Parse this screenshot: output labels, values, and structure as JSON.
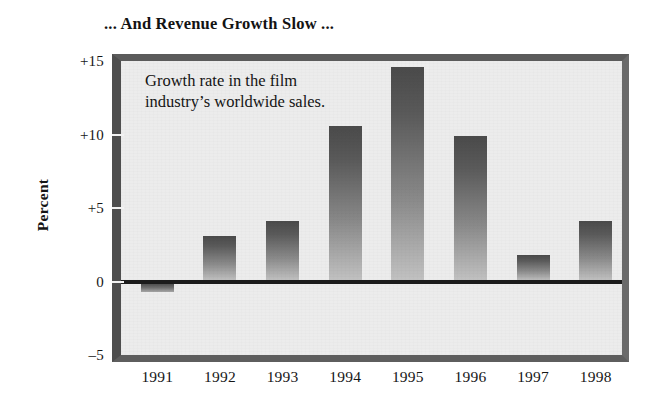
{
  "chart_data": {
    "type": "bar",
    "title": "... And Revenue Growth Slow ...",
    "annotation": "Growth rate in the film industry’s worldwide sales.",
    "xlabel": "",
    "ylabel": "Percent",
    "categories": [
      "1991",
      "1992",
      "1993",
      "1994",
      "1995",
      "1996",
      "1997",
      "1998"
    ],
    "values": [
      -0.7,
      3.1,
      4.1,
      10.6,
      14.6,
      9.9,
      1.8,
      4.1
    ],
    "ylim": [
      -5,
      15
    ],
    "yticks": [
      15,
      10,
      5,
      0,
      -5
    ],
    "ytick_labels": [
      "+15",
      "+10",
      "+5",
      "0",
      "–5"
    ],
    "grid": false,
    "legend": "none",
    "zero_line": true,
    "colors": {
      "bar_top": "#4a4a4a",
      "bar_bottom": "#c2c2c2",
      "plot_background": "#ececec",
      "frame": "#5b5b5b",
      "zero_line": "#1b1b1b",
      "text": "#141414",
      "page_background": "#ffffff"
    }
  }
}
